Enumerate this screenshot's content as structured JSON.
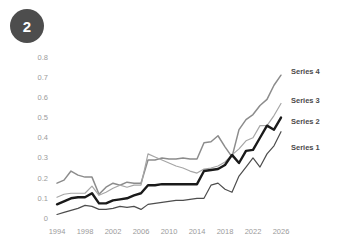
{
  "badge": {
    "label": "2",
    "color": "#4d4d4d",
    "text_color": "#ffffff"
  },
  "legend": {
    "position": "right",
    "entries": [
      {
        "label": "Series 4",
        "color": "#8c8c8c"
      },
      {
        "label": "Series 3",
        "color": "#a6a6a6"
      },
      {
        "label": "Series 2",
        "color": "#1a1a1a"
      },
      {
        "label": "Series 1",
        "color": "#4d4d4d"
      }
    ]
  },
  "axes": {
    "y_ticks": [
      "0.8",
      "0.7",
      "0.6",
      "0.5",
      "0.4",
      "0.3",
      "0.2",
      "0.1",
      "0"
    ],
    "x_ticks": [
      "1994",
      "1998",
      "2002",
      "2006",
      "2010",
      "2014",
      "2018",
      "2022",
      "2026"
    ],
    "tick_color": "#9b9b9b"
  },
  "chart_data": {
    "type": "line",
    "title": "",
    "subtitle": "",
    "xlabel": "",
    "ylabel": "",
    "xlim": [
      1994,
      2026
    ],
    "ylim": [
      0,
      0.8
    ],
    "grid": false,
    "legend_position": "right",
    "x": [
      1994,
      1995,
      1996,
      1997,
      1998,
      1999,
      2000,
      2001,
      2002,
      2003,
      2004,
      2005,
      2006,
      2007,
      2008,
      2009,
      2010,
      2011,
      2012,
      2013,
      2014,
      2015,
      2016,
      2017,
      2018,
      2019,
      2020,
      2021,
      2022,
      2023,
      2024,
      2025,
      2026
    ],
    "series": [
      {
        "name": "Series 4",
        "color": "#8c8c8c",
        "values": [
          0.175,
          0.19,
          0.235,
          0.215,
          0.205,
          0.205,
          0.12,
          0.155,
          0.175,
          0.165,
          0.18,
          0.175,
          0.175,
          0.29,
          0.29,
          0.3,
          0.295,
          0.295,
          0.3,
          0.295,
          0.295,
          0.375,
          0.38,
          0.41,
          0.355,
          0.305,
          0.44,
          0.49,
          0.515,
          0.56,
          0.59,
          0.66,
          0.71
        ]
      },
      {
        "name": "Series 3",
        "color": "#a6a6a6",
        "values": [
          0.105,
          0.12,
          0.125,
          0.125,
          0.125,
          0.16,
          0.115,
          0.13,
          0.15,
          0.165,
          0.155,
          0.165,
          0.165,
          0.32,
          0.305,
          0.29,
          0.275,
          0.26,
          0.25,
          0.235,
          0.225,
          0.245,
          0.25,
          0.26,
          0.28,
          0.315,
          0.345,
          0.385,
          0.4,
          0.46,
          0.46,
          0.51,
          0.57
        ]
      },
      {
        "name": "Series 2",
        "color": "#1a1a1a",
        "values": [
          0.07,
          0.085,
          0.1,
          0.105,
          0.105,
          0.125,
          0.075,
          0.075,
          0.09,
          0.095,
          0.1,
          0.115,
          0.125,
          0.165,
          0.165,
          0.17,
          0.17,
          0.17,
          0.17,
          0.17,
          0.17,
          0.235,
          0.24,
          0.245,
          0.265,
          0.315,
          0.275,
          0.335,
          0.34,
          0.4,
          0.46,
          0.44,
          0.5
        ]
      },
      {
        "name": "Series 1",
        "color": "#4d4d4d",
        "values": [
          0.02,
          0.03,
          0.04,
          0.05,
          0.065,
          0.06,
          0.045,
          0.045,
          0.05,
          0.06,
          0.055,
          0.06,
          0.045,
          0.07,
          0.075,
          0.08,
          0.085,
          0.09,
          0.09,
          0.095,
          0.1,
          0.1,
          0.165,
          0.175,
          0.145,
          0.13,
          0.21,
          0.255,
          0.3,
          0.255,
          0.32,
          0.36,
          0.43
        ]
      }
    ]
  }
}
